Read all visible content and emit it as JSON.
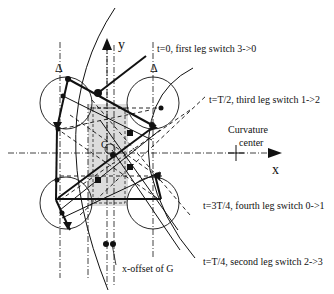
{
  "diagram": {
    "axes": {
      "y_label": "y",
      "x_label": "x",
      "center_label_line1": "Curvature",
      "center_label_line2": "center",
      "origin_label": "C"
    },
    "annotations": [
      {
        "id": "t0",
        "text": "t=0, first leg switch 3->0"
      },
      {
        "id": "tT2",
        "text": "t=T/2, third leg switch 1->2"
      },
      {
        "id": "t3T4",
        "text": "t=3T/4, fourth leg switch 0->1"
      },
      {
        "id": "tT4",
        "text": "t=T/4, second leg switch 2->3"
      }
    ],
    "offset_label": "x-offset of G",
    "delta_left": "Δ",
    "delta_right": "Δ",
    "colors": {
      "line": "#111111",
      "shaded_region": "#d9d9d9",
      "background": "#ffffff"
    }
  }
}
